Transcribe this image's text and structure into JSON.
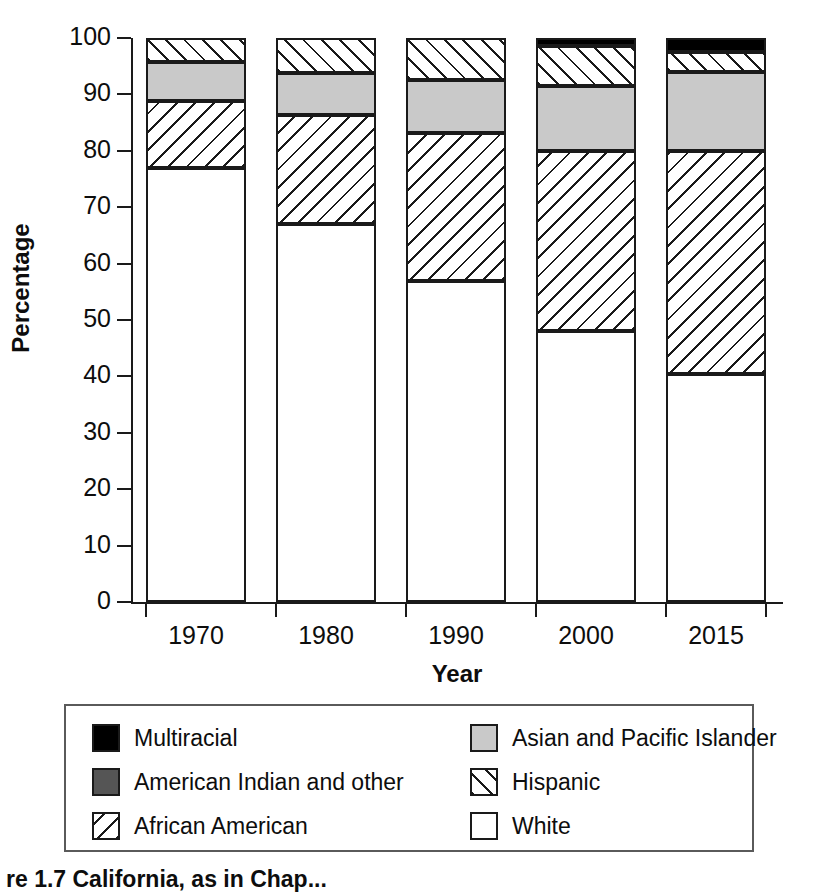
{
  "chart_data": {
    "type": "bar",
    "subtype": "stacked-bar-100-percent",
    "title": "",
    "xlabel": "Year",
    "ylabel": "Percentage",
    "ylim": [
      0,
      100
    ],
    "ytick_step": 10,
    "yticks": [
      0,
      10,
      20,
      30,
      40,
      50,
      60,
      70,
      80,
      90,
      100
    ],
    "grid": false,
    "legend_position": "below-plot",
    "categories": [
      "1970",
      "1980",
      "1990",
      "2000",
      "2015"
    ],
    "stack_order_bottom_to_top": [
      "White",
      "African American",
      "Asian and Pacific Islander",
      "Hispanic",
      "American Indian and other",
      "Multiracial"
    ],
    "series": [
      {
        "name": "White",
        "values": [
          77.0,
          67.0,
          57.0,
          48.0,
          40.5
        ]
      },
      {
        "name": "African American",
        "values": [
          11.8,
          19.3,
          26.2,
          32.0,
          39.5
        ]
      },
      {
        "name": "Asian and Pacific Islander",
        "values": [
          7.0,
          7.5,
          9.3,
          11.5,
          14.0
        ]
      },
      {
        "name": "Hispanic",
        "values": [
          4.2,
          6.2,
          7.5,
          7.0,
          3.5
        ]
      },
      {
        "name": "American Indian and other",
        "values": [
          0.0,
          0.0,
          0.0,
          0.0,
          0.0
        ]
      },
      {
        "name": "Multiracial",
        "values": [
          0.0,
          0.0,
          0.0,
          1.5,
          2.5
        ]
      }
    ],
    "cumulative_tops": {
      "1970": {
        "White": 77.0,
        "African American": 88.8,
        "Asian and Pacific Islander": 95.8,
        "Hispanic": 100.0
      },
      "1980": {
        "White": 67.0,
        "African American": 86.3,
        "Asian and Pacific Islander": 93.8,
        "Hispanic": 100.0
      },
      "1990": {
        "White": 57.0,
        "African American": 83.2,
        "Asian and Pacific Islander": 92.5,
        "Hispanic": 100.0
      },
      "2000": {
        "White": 48.0,
        "African American": 80.0,
        "Asian and Pacific Islander": 91.5,
        "Hispanic": 98.5,
        "Multiracial": 100.0
      },
      "2015": {
        "White": 40.5,
        "African American": 80.0,
        "Asian and Pacific Islander": 94.0,
        "Hispanic": 97.5,
        "Multiracial": 100.0
      }
    }
  },
  "axes": {
    "y_title": "Percentage",
    "x_title": "Year",
    "y_tick_labels": [
      "100",
      "90",
      "80",
      "70",
      "60",
      "50",
      "40",
      "30",
      "20",
      "10",
      "0"
    ],
    "x_tick_labels": [
      "1970",
      "1980",
      "1990",
      "2000",
      "2015"
    ]
  },
  "legend": {
    "items": [
      {
        "label": "Multiracial",
        "pattern": "solid-black",
        "color": "#000000"
      },
      {
        "label": "Asian and Pacific Islander",
        "pattern": "solid-light-gray",
        "color": "#c9c9c9"
      },
      {
        "label": "American Indian and other",
        "pattern": "solid-dark-gray",
        "color": "#555555"
      },
      {
        "label": "Hispanic",
        "pattern": "forward-slash-hatch",
        "color": "#ffffff"
      },
      {
        "label": "African American",
        "pattern": "back-slash-hatch",
        "color": "#ffffff"
      },
      {
        "label": "White",
        "pattern": "empty-white",
        "color": "#ffffff"
      }
    ]
  },
  "caption": {
    "text": "re 1.7  California, as in Chap..."
  },
  "colors": {
    "axis": "#1a1a1a",
    "multiracial": "#000000",
    "american_indian": "#555555",
    "asian_pacific": "#c9c9c9",
    "white_group": "#ffffff",
    "legend_border": "#5a5a5a"
  }
}
